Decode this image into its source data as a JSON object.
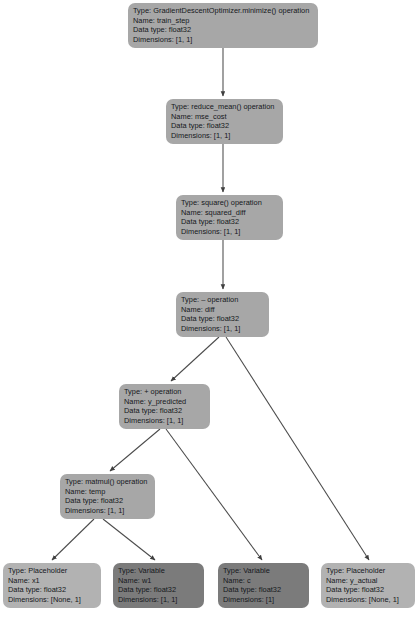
{
  "diagram": {
    "label_prefixes": {
      "type": "Type:",
      "name": "Name:",
      "dtype": "Data type:",
      "dims": "Dimensions:"
    },
    "colors": {
      "operation_node": "#a7a7a7",
      "placeholder_node": "#b2b2b2",
      "variable_node": "#7b7b7b",
      "edge": "#4b4b4b",
      "text": "#15181c",
      "background": "#ffffff"
    },
    "nodes": [
      {
        "id": "train_step",
        "kind": "operation",
        "type": "Type: GradientDescentOptimizer.minimize() operation",
        "name": "Name: train_step",
        "dtype": "Data type: float32",
        "dims": "Dimensions: [1, 1]"
      },
      {
        "id": "mse_cost",
        "kind": "operation",
        "type": "Type: reduce_mean() operation",
        "name": "Name: mse_cost",
        "dtype": "Data type: float32",
        "dims": "Dimensions: [1, 1]"
      },
      {
        "id": "squared_diff",
        "kind": "operation",
        "type": "Type: square() operation",
        "name": "Name: squared_diff",
        "dtype": "Data type: float32",
        "dims": "Dimensions: [1, 1]"
      },
      {
        "id": "diff",
        "kind": "operation",
        "type": "Type: – operation",
        "name": "Name: diff",
        "dtype": "Data type: float32",
        "dims": "Dimensions: [1, 1]"
      },
      {
        "id": "y_predicted",
        "kind": "operation",
        "type": "Type: + operation",
        "name": "Name: y_predicted",
        "dtype": "Data type: float32",
        "dims": "Dimensions: [1, 1]"
      },
      {
        "id": "temp",
        "kind": "operation",
        "type": "Type: matmul() operation",
        "name": "Name: temp",
        "dtype": "Data type: float32",
        "dims": "Dimensions: [1, 1]"
      },
      {
        "id": "x1",
        "kind": "placeholder",
        "type": "Type: Placeholder",
        "name": "Name: x1",
        "dtype": "Data type: float32",
        "dims": "Dimensions: [None, 1]"
      },
      {
        "id": "w1",
        "kind": "variable",
        "type": "Type: Variable",
        "name": "Name: w1",
        "dtype": "Data type: float32",
        "dims": "Dimensions: [1, 1]"
      },
      {
        "id": "c",
        "kind": "variable",
        "type": "Type: Variable",
        "name": "Name: c",
        "dtype": "Data type: float32",
        "dims": "Dimensions: [1]"
      },
      {
        "id": "y_actual",
        "kind": "placeholder",
        "type": "Type: Placeholder",
        "name": "Name: y_actual",
        "dtype": "Data type: float32",
        "dims": "Dimensions: [None, 1]"
      }
    ],
    "edges": [
      {
        "from": "train_step",
        "to": "mse_cost"
      },
      {
        "from": "mse_cost",
        "to": "squared_diff"
      },
      {
        "from": "squared_diff",
        "to": "diff"
      },
      {
        "from": "diff",
        "to": "y_predicted"
      },
      {
        "from": "diff",
        "to": "y_actual"
      },
      {
        "from": "y_predicted",
        "to": "temp"
      },
      {
        "from": "y_predicted",
        "to": "c"
      },
      {
        "from": "temp",
        "to": "x1"
      },
      {
        "from": "temp",
        "to": "w1"
      }
    ]
  }
}
